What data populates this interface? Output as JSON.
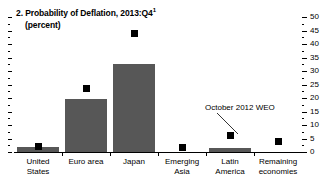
{
  "chart_data": {
    "type": "bar",
    "title": "2. Probability of Deflation, 2013:Q4",
    "title_footnote": "1",
    "subtitle": "(percent)",
    "xlabel": "",
    "ylabel": "",
    "ylim": [
      0,
      50
    ],
    "ytick_step": 5,
    "grid": false,
    "axis_side": "right",
    "categories": [
      "United\nStates",
      "Euro area",
      "Japan",
      "Emerging Asia",
      "Latin\nAmerica",
      "Remaining\neconomies"
    ],
    "ytick_labels": [
      "0",
      "5",
      "10",
      "15",
      "20",
      "25",
      "30",
      "35",
      "40",
      "45",
      "50"
    ],
    "series": [
      {
        "name": "Current",
        "type": "bar",
        "color": "#575757",
        "values": [
          2,
          19.5,
          32.5,
          0,
          1.5,
          0
        ]
      },
      {
        "name": "October 2012 WEO",
        "type": "marker",
        "color": "#000000",
        "values": [
          2,
          23.5,
          44,
          1.5,
          6,
          4
        ]
      }
    ],
    "annotations": [
      {
        "text": "October 2012 WEO",
        "points_to_category": "Latin America"
      }
    ]
  }
}
